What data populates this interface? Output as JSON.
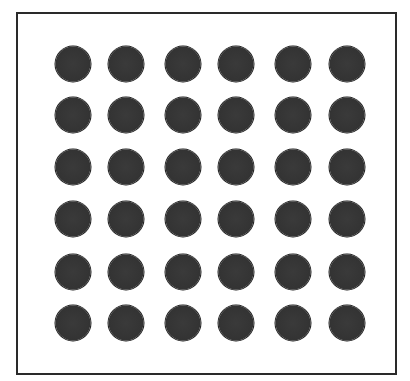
{
  "figure": {
    "rows": 6,
    "columns": 6,
    "dot_color": "#333333",
    "border_color": "#2a2a2a",
    "background_color": "#ffffff",
    "column_centers": [
      73,
      126,
      183,
      236,
      293,
      347
    ],
    "row_centers": [
      64,
      115,
      167,
      219,
      272,
      323
    ],
    "dot_diameter": 35
  }
}
